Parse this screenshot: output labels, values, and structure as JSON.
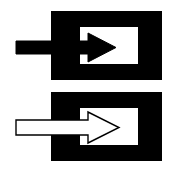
{
  "figure": {
    "caption": "Two stacked black rectangular blocks, each with a white rectangular notch cut into the right side; a horizontal arrow points rightward into each notch.",
    "background_color": "#ffffff",
    "canvas": {
      "width": 170,
      "height": 170
    },
    "panels": [
      {
        "id": "top-panel",
        "name": "filled-arrow-panel",
        "label": "Top panel: solid black arrow entering notched block",
        "block": {
          "name": "black-block",
          "fill": "#000000",
          "stroke": "none",
          "x": 51,
          "y": 11,
          "width": 111,
          "height": 69
        },
        "notch": {
          "name": "white-notch",
          "fill": "#ffffff",
          "x": 80,
          "y": 27,
          "width": 58,
          "height": 37
        },
        "arrow": {
          "name": "solid-black-arrow",
          "style": "filled",
          "fill": "#000000",
          "stroke": "#000000",
          "stroke_width": 1,
          "direction": "right",
          "shaft": {
            "x": 16,
            "y": 41,
            "width": 73,
            "height": 13
          },
          "head": {
            "base_x": 88,
            "tip_x": 116,
            "top_y": 33,
            "bottom_y": 62
          },
          "tip_point": {
            "x": 116,
            "y": 47
          }
        }
      },
      {
        "id": "bottom-panel",
        "name": "outline-arrow-panel",
        "label": "Bottom panel: white outlined arrow entering notched block",
        "block": {
          "name": "black-block",
          "fill": "#000000",
          "stroke": "none",
          "x": 51,
          "y": 92,
          "width": 111,
          "height": 69
        },
        "notch": {
          "name": "white-notch",
          "fill": "#ffffff",
          "x": 80,
          "y": 108,
          "width": 58,
          "height": 37
        },
        "arrow": {
          "name": "outlined-white-arrow",
          "style": "outlined",
          "fill": "#ffffff",
          "stroke": "#000000",
          "stroke_width": 1.4,
          "direction": "right",
          "shaft": {
            "x": 16,
            "y": 120,
            "width": 73,
            "height": 15
          },
          "head": {
            "base_x": 88,
            "tip_x": 119,
            "top_y": 112,
            "bottom_y": 143
          },
          "tip_point": {
            "x": 119,
            "y": 127
          }
        }
      }
    ],
    "colors": {
      "block_fill": "#000000",
      "notch_fill": "#ffffff",
      "arrow_filled": "#000000",
      "arrow_outline_fill": "#ffffff",
      "arrow_outline_stroke": "#000000",
      "page_background": "#ffffff"
    }
  }
}
